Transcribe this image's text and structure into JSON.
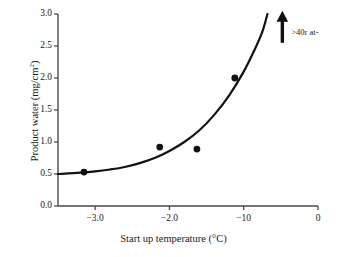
{
  "chart_data": {
    "type": "scatter",
    "title": "",
    "xlabel": "Start up temperature (°C)",
    "ylabel": "Product water (mg/cm²)",
    "ylabel_main": "Product water (mg/cm",
    "ylabel_sup": "2",
    "ylabel_close": ")",
    "xlim": [
      -3.5,
      0
    ],
    "ylim": [
      0.0,
      3.0
    ],
    "grid": false,
    "legend": null,
    "xticks": [
      -3.0,
      -2.0,
      -1.0,
      0
    ],
    "xtick_labels": [
      "−3.0",
      "−2.0",
      "−10",
      "0"
    ],
    "yticks": [
      0.0,
      0.5,
      1.0,
      1.5,
      2.0,
      2.5,
      3.0
    ],
    "ytick_labels": [
      "0.0",
      "0.5",
      "1.0",
      "1.5",
      "2.0",
      "2.5",
      "3.0"
    ],
    "series": [
      {
        "name": "Measured product water",
        "marker": "filled-circle",
        "color": "#111111",
        "x": [
          -3.15,
          -2.13,
          -1.63,
          -1.12
        ],
        "y": [
          0.53,
          0.92,
          0.89,
          2.0
        ]
      },
      {
        "name": "Fitted trend curve",
        "marker": "none",
        "line": "solid",
        "color": "#111111",
        "x": [
          -3.5,
          -3.2,
          -3.0,
          -2.8,
          -2.6,
          -2.4,
          -2.2,
          -2.0,
          -1.8,
          -1.6,
          -1.4,
          -1.2,
          -1.0,
          -0.85,
          -0.75,
          -0.68
        ],
        "y": [
          0.5,
          0.52,
          0.54,
          0.57,
          0.61,
          0.67,
          0.75,
          0.86,
          1.0,
          1.18,
          1.42,
          1.72,
          2.1,
          2.45,
          2.72,
          3.0
        ]
      }
    ],
    "annotations": [
      {
        "name": "up-arrow-annotation",
        "kind": "arrow",
        "direction": "up",
        "x": -0.48,
        "y_start": 2.55,
        "y_end": 3.05
      },
      {
        "name": "annotation-label",
        "kind": "text",
        "text": ">40r at-",
        "x": -0.36,
        "y": 2.72
      }
    ]
  },
  "figure": {
    "background_color": "#ffffff",
    "axis_color": "#4a4a4a",
    "data_color": "#111111"
  }
}
